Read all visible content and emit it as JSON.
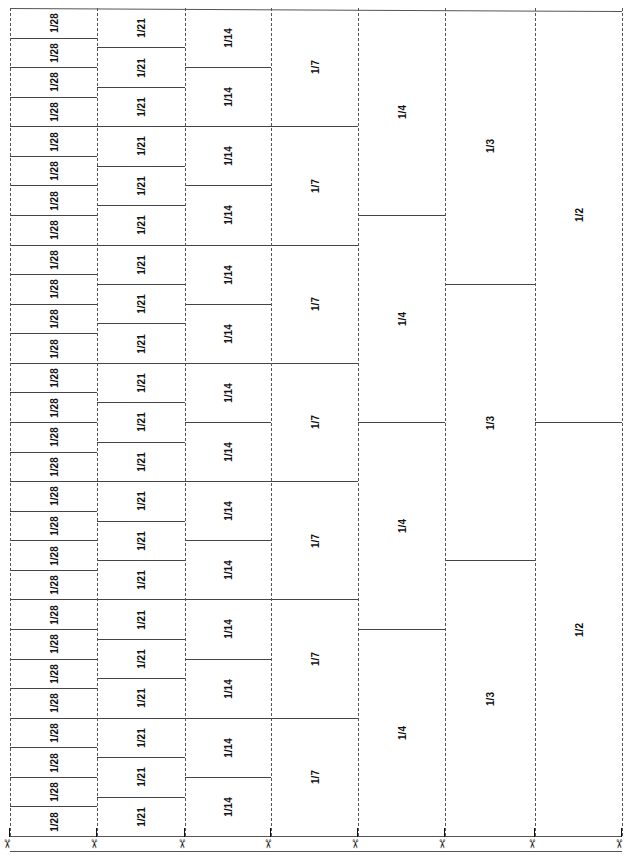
{
  "sheet": {
    "title": "Fraction strips",
    "total_height_px": 828,
    "columns": [
      {
        "id": "c28",
        "label": "1/28",
        "count": 28
      },
      {
        "id": "c21",
        "label": "1/21",
        "count": 21
      },
      {
        "id": "c14",
        "label": "1/14",
        "count": 14
      },
      {
        "id": "c7",
        "label": "1/7",
        "count": 7
      },
      {
        "id": "c4",
        "label": "1/4",
        "count": 4
      },
      {
        "id": "c3",
        "label": "1/3",
        "count": 3
      },
      {
        "id": "c2",
        "label": "1/2",
        "count": 2
      }
    ],
    "column_edges_x": [
      10,
      97,
      185,
      271,
      358,
      445,
      535,
      622
    ],
    "cut_marks": {
      "icon": "scissors-icon",
      "glyph": "✂",
      "count": 8
    },
    "line_color": "#444444",
    "text_color": "#111111"
  }
}
